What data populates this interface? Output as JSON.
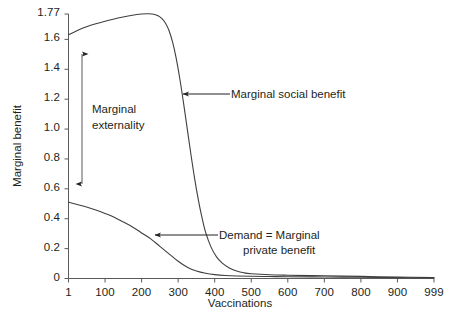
{
  "chart_data": {
    "type": "line",
    "title": "",
    "xlabel": "Vaccinations",
    "ylabel": "Marginal benefit",
    "xlim": [
      1,
      999
    ],
    "ylim": [
      0,
      1.77
    ],
    "grid": false,
    "legend": "none",
    "xticks": [
      {
        "value": 1,
        "label": "1"
      },
      {
        "value": 100,
        "label": "100"
      },
      {
        "value": 200,
        "label": "200"
      },
      {
        "value": 300,
        "label": "300"
      },
      {
        "value": 400,
        "label": "400"
      },
      {
        "value": 500,
        "label": "500"
      },
      {
        "value": 600,
        "label": "600"
      },
      {
        "value": 700,
        "label": "700"
      },
      {
        "value": 800,
        "label": "800"
      },
      {
        "value": 900,
        "label": "900"
      },
      {
        "value": 999,
        "label": "999"
      }
    ],
    "yticks": [
      {
        "value": 0,
        "label": "0"
      },
      {
        "value": 0.2,
        "label": "0.2"
      },
      {
        "value": 0.4,
        "label": "0.4"
      },
      {
        "value": 0.6,
        "label": "0.6"
      },
      {
        "value": 0.8,
        "label": "0.8"
      },
      {
        "value": 1.0,
        "label": "1.0"
      },
      {
        "value": 1.2,
        "label": "1.2"
      },
      {
        "value": 1.4,
        "label": "1.4"
      },
      {
        "value": 1.6,
        "label": "1.6"
      },
      {
        "value": 1.77,
        "label": "1.77"
      }
    ],
    "series": [
      {
        "name": "Marginal social benefit",
        "color": "#3f3f3f",
        "x": [
          1,
          25,
          50,
          75,
          100,
          125,
          150,
          175,
          200,
          215,
          230,
          245,
          255,
          265,
          275,
          285,
          295,
          305,
          315,
          325,
          335,
          345,
          355,
          365,
          375,
          390,
          405,
          420,
          440,
          460,
          480,
          500,
          550,
          600,
          700,
          800,
          900,
          999
        ],
        "values": [
          1.63,
          1.66,
          1.685,
          1.705,
          1.722,
          1.737,
          1.75,
          1.762,
          1.77,
          1.772,
          1.77,
          1.758,
          1.74,
          1.71,
          1.66,
          1.58,
          1.47,
          1.33,
          1.17,
          1.0,
          0.83,
          0.67,
          0.53,
          0.41,
          0.31,
          0.21,
          0.145,
          0.105,
          0.07,
          0.05,
          0.038,
          0.032,
          0.025,
          0.022,
          0.018,
          0.014,
          0.01,
          0.006
        ]
      },
      {
        "name": "Demand = Marginal private benefit",
        "color": "#3f3f3f",
        "x": [
          1,
          25,
          50,
          75,
          100,
          125,
          150,
          175,
          200,
          225,
          250,
          275,
          300,
          325,
          350,
          375,
          400,
          430,
          460,
          500,
          550,
          600,
          700,
          800,
          900,
          999
        ],
        "values": [
          0.51,
          0.495,
          0.478,
          0.458,
          0.435,
          0.41,
          0.378,
          0.345,
          0.305,
          0.265,
          0.215,
          0.165,
          0.115,
          0.075,
          0.05,
          0.035,
          0.026,
          0.02,
          0.017,
          0.015,
          0.013,
          0.012,
          0.01,
          0.008,
          0.006,
          0.004
        ]
      }
    ],
    "annotations": [
      {
        "name": "marginal-social-benefit",
        "text": "Marginal social benefit",
        "arrow_from": [
          230,
          94
        ],
        "arrow_to": [
          180,
          94
        ]
      },
      {
        "name": "demand-marginal-private-benefit",
        "line1": "Demand = Marginal",
        "line2": "private benefit",
        "arrow_from": [
          218,
          235
        ],
        "arrow_to": [
          152,
          235
        ]
      },
      {
        "name": "marginal-externality",
        "line1": "Marginal",
        "line2": "externality",
        "double_arrow_x": 82,
        "double_arrow_top": 47,
        "double_arrow_bottom": 191
      }
    ]
  },
  "axis": {
    "ylabel": "Marginal benefit",
    "xlabel": "Vaccinations"
  }
}
